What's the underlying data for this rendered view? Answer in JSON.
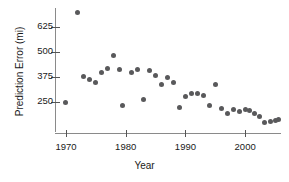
{
  "chart_data": {
    "type": "scatter",
    "title": "",
    "xlabel": "Year",
    "ylabel": "Prediction Error (mi)",
    "xlim": [
      1968.5,
      2006.0
    ],
    "ylim": [
      100,
      720
    ],
    "xticks": [
      1970,
      1980,
      1990,
      2000
    ],
    "yticks": [
      250,
      375,
      500,
      625
    ],
    "grid": false,
    "legend": null,
    "marker_color": "#59595b",
    "axis_color": "#8a8a8a",
    "points": [
      {
        "x": 1970,
        "y": 250
      },
      {
        "x": 1972,
        "y": 700
      },
      {
        "x": 1973,
        "y": 378
      },
      {
        "x": 1974,
        "y": 362
      },
      {
        "x": 1975,
        "y": 348
      },
      {
        "x": 1976,
        "y": 400
      },
      {
        "x": 1977,
        "y": 418
      },
      {
        "x": 1978,
        "y": 482
      },
      {
        "x": 1979,
        "y": 415
      },
      {
        "x": 1979.5,
        "y": 235
      },
      {
        "x": 1981,
        "y": 398
      },
      {
        "x": 1982,
        "y": 412
      },
      {
        "x": 1983,
        "y": 265
      },
      {
        "x": 1984,
        "y": 408
      },
      {
        "x": 1985,
        "y": 382
      },
      {
        "x": 1986,
        "y": 338
      },
      {
        "x": 1987,
        "y": 372
      },
      {
        "x": 1988,
        "y": 348
      },
      {
        "x": 1989,
        "y": 222
      },
      {
        "x": 1990,
        "y": 278
      },
      {
        "x": 1991,
        "y": 292
      },
      {
        "x": 1992,
        "y": 295
      },
      {
        "x": 1993,
        "y": 282
      },
      {
        "x": 1994,
        "y": 232
      },
      {
        "x": 1995,
        "y": 338
      },
      {
        "x": 1996,
        "y": 218
      },
      {
        "x": 1997,
        "y": 192
      },
      {
        "x": 1998,
        "y": 212
      },
      {
        "x": 1999,
        "y": 205
      },
      {
        "x": 2000,
        "y": 212
      },
      {
        "x": 2000.8,
        "y": 210
      },
      {
        "x": 2001.6,
        "y": 195
      },
      {
        "x": 2002.4,
        "y": 178
      },
      {
        "x": 2003.2,
        "y": 148
      },
      {
        "x": 2004.2,
        "y": 155
      },
      {
        "x": 2005.0,
        "y": 158
      },
      {
        "x": 2005.6,
        "y": 162
      }
    ]
  }
}
